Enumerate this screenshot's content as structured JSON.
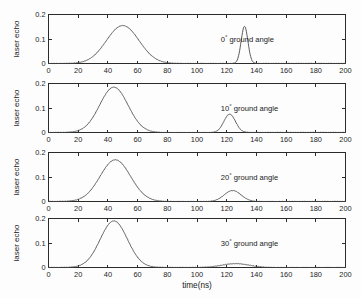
{
  "chart_data": {
    "type": "line",
    "title": "",
    "xlabel": "time(ns)",
    "ylabel": "laser echo",
    "xlim": [
      0,
      200
    ],
    "ylim": [
      0,
      0.2
    ],
    "xticks": [
      0,
      20,
      40,
      60,
      80,
      100,
      120,
      140,
      160,
      180,
      200
    ],
    "yticks": [
      0,
      0.1,
      0.2
    ],
    "ytick_labels": [
      "0",
      "0.1",
      "0.2"
    ],
    "grid": false,
    "legend": "none",
    "panels": [
      {
        "id": "panel-0deg",
        "annotation": "ground angle",
        "angle": "0",
        "degree_symbol": "°",
        "ylabel": "laser echo",
        "xlabel": "",
        "pulses": [
          {
            "name": "target-echo",
            "center": 50,
            "amplitude": 0.155,
            "width": 15.5
          },
          {
            "name": "ground-echo",
            "center": 132,
            "amplitude": 0.152,
            "width": 3.2
          }
        ]
      },
      {
        "id": "panel-10deg",
        "annotation": "ground angle",
        "angle": "10",
        "degree_symbol": "°",
        "ylabel": "laser echo",
        "xlabel": "",
        "pulses": [
          {
            "name": "target-echo",
            "center": 44,
            "amplitude": 0.185,
            "width": 13.5
          },
          {
            "name": "ground-echo",
            "center": 122,
            "amplitude": 0.075,
            "width": 5.5
          }
        ]
      },
      {
        "id": "panel-20deg",
        "annotation": "ground angle",
        "angle": "20",
        "degree_symbol": "°",
        "ylabel": "laser echo",
        "xlabel": "",
        "pulses": [
          {
            "name": "target-echo",
            "center": 45,
            "amplitude": 0.17,
            "width": 14.5
          },
          {
            "name": "ground-echo",
            "center": 124,
            "amplitude": 0.045,
            "width": 8.0
          }
        ]
      },
      {
        "id": "panel-30deg",
        "annotation": "ground angle",
        "angle": "30",
        "degree_symbol": "°",
        "ylabel": "laser echo",
        "xlabel": "time(ns)",
        "pulses": [
          {
            "name": "target-echo",
            "center": 44,
            "amplitude": 0.19,
            "width": 13.0
          },
          {
            "name": "ground-echo",
            "center": 126,
            "amplitude": 0.016,
            "width": 13.0
          }
        ]
      }
    ],
    "colors": {
      "curve": "#4a4a4a",
      "axis": "#2b2b2b",
      "background": "#fdfdfd",
      "text": "#1a1a1a"
    }
  }
}
